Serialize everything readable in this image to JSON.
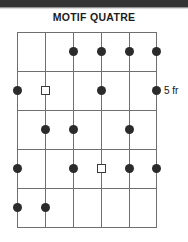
{
  "header": {
    "title": "MOTIF QUATRE"
  },
  "diagram": {
    "type": "guitar-fretboard",
    "position_label": "5 fr",
    "string_count": 6,
    "fret_count": 5,
    "colors": {
      "note_fill": "#2b2b2b",
      "root_outline": "#3a3a3a",
      "gridline": "#6f6f6f",
      "text": "#1b1b1b",
      "background": "#ffffff",
      "scan_band": "#343434"
    },
    "geometry": {
      "left": 17,
      "right": 156,
      "top": 32,
      "bottom": 227,
      "string_x": [
        17,
        45,
        73,
        101,
        129,
        156
      ],
      "fret_y": [
        32,
        71,
        110,
        149,
        188,
        227
      ]
    },
    "markers": [
      {
        "name": "note-r1-s3",
        "shape": "dot",
        "string": 3,
        "fret": 1
      },
      {
        "name": "note-r1-s4",
        "shape": "dot",
        "string": 4,
        "fret": 1
      },
      {
        "name": "note-r1-s5",
        "shape": "dot",
        "string": 5,
        "fret": 1
      },
      {
        "name": "note-r1-s6",
        "shape": "dot",
        "string": 6,
        "fret": 1
      },
      {
        "name": "note-r2-s1",
        "shape": "dot",
        "string": 1,
        "fret": 2
      },
      {
        "name": "root-r2-s2",
        "shape": "square",
        "string": 2,
        "fret": 2
      },
      {
        "name": "note-r2-s4",
        "shape": "dot",
        "string": 4,
        "fret": 2
      },
      {
        "name": "note-r2-s6",
        "shape": "dot",
        "string": 6,
        "fret": 2
      },
      {
        "name": "note-r3-s2",
        "shape": "dot",
        "string": 2,
        "fret": 3
      },
      {
        "name": "note-r3-s3",
        "shape": "dot",
        "string": 3,
        "fret": 3
      },
      {
        "name": "note-r3-s5",
        "shape": "dot",
        "string": 5,
        "fret": 3
      },
      {
        "name": "note-r4-s1",
        "shape": "dot",
        "string": 1,
        "fret": 4
      },
      {
        "name": "note-r4-s3",
        "shape": "dot",
        "string": 3,
        "fret": 4
      },
      {
        "name": "root-r4-s4",
        "shape": "square",
        "string": 4,
        "fret": 4
      },
      {
        "name": "note-r4-s5",
        "shape": "dot",
        "string": 5,
        "fret": 4
      },
      {
        "name": "note-r4-s6",
        "shape": "dot",
        "string": 6,
        "fret": 4
      },
      {
        "name": "note-r5-s1",
        "shape": "dot",
        "string": 1,
        "fret": 5
      },
      {
        "name": "note-r5-s2",
        "shape": "dot",
        "string": 2,
        "fret": 5
      }
    ]
  }
}
